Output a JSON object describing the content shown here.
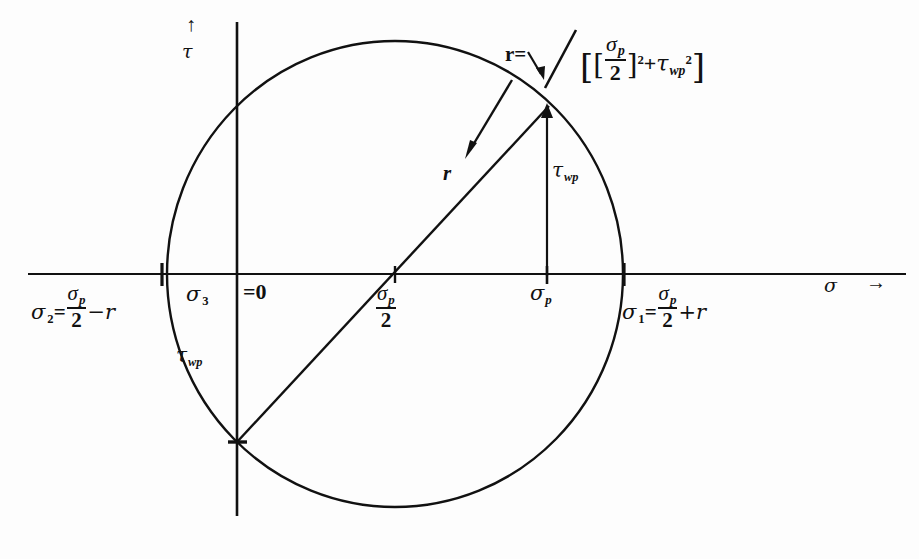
{
  "figure": {
    "type": "mohr-circle-diagram",
    "axes": {
      "vertical": {
        "symbol": "τ",
        "arrow": "↑",
        "name": "shear-stress-axis"
      },
      "horizontal": {
        "symbol": "σ",
        "arrow": "→",
        "name": "normal-stress-axis"
      }
    },
    "labels": {
      "sigma2": {
        "symbol": "σ",
        "subscript": "2",
        "equals": "=",
        "numerator": "σ",
        "num_subscript": "p",
        "denominator": "2",
        "tail": "−r"
      },
      "sigma3": {
        "symbol": "σ",
        "subscript": "3"
      },
      "sigma3_value": "=0",
      "sigma_p_half": {
        "numerator": "σ",
        "num_subscript": "p",
        "denominator": "2"
      },
      "sigma_p": {
        "symbol": "σ",
        "subscript": "p"
      },
      "sigma1": {
        "symbol": "σ",
        "subscript": "1",
        "equals": "=",
        "numerator": "σ",
        "num_subscript": "p",
        "denominator": "2",
        "tail": "+r"
      },
      "tau_wp_left": {
        "symbol": "τ",
        "subscript": "wp"
      },
      "tau_wp_vertical": {
        "symbol": "τ",
        "subscript": "wp"
      },
      "radius": "r",
      "radius_equals": "r="
    },
    "formula": {
      "lhs": "r=",
      "radical": "√",
      "open_outer": "[",
      "open_inner": "[",
      "numerator": "σ",
      "num_subscript": "p",
      "denominator": "2",
      "close_inner": "]",
      "exponent_first": "2",
      "plus": "+",
      "tau_symbol": "τ",
      "tau_subscript": "wp",
      "exponent_second": "2",
      "close_outer": "]",
      "plain_text": "r = √[ [σp/2]² + τwp² ]"
    },
    "geometry": {
      "circle_center_x": 395,
      "circle_center_y": 274,
      "circle_radius": 228,
      "sigma_axis_y": 274,
      "tau_axis_x": 237,
      "sigma_p_x": 547,
      "point_top_x": 547,
      "point_top_y": 108,
      "point_bottom_x": 237,
      "point_bottom_y": 442
    },
    "colors": {
      "ink": "#111111",
      "background": "#fdfdfd"
    }
  }
}
